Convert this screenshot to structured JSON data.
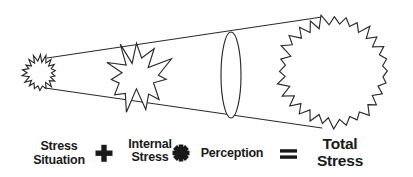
{
  "diagram": {
    "type": "conceptual-equation",
    "background_color": "#ffffff",
    "stroke_color": "#2b2b2b",
    "text_color": "#1a1a1a",
    "equation": {
      "terms": [
        {
          "id": "stress-situation",
          "line1": "Stress",
          "line2": "Situation",
          "emphasis": "normal"
        },
        {
          "id": "internal-stress",
          "line1": "Internal",
          "line2": "Stress",
          "emphasis": "normal"
        },
        {
          "id": "perception",
          "line1": "Perception",
          "line2": "",
          "emphasis": "normal"
        },
        {
          "id": "total-stress",
          "line1": "Total",
          "line2": "Stress",
          "emphasis": "large"
        }
      ],
      "operators": [
        {
          "id": "plus",
          "symbol": "+",
          "name": "plus-operator"
        },
        {
          "id": "times",
          "symbol": "✖",
          "name": "multiply-operator"
        },
        {
          "id": "equals",
          "symbol": "=",
          "name": "equals-operator"
        }
      ],
      "expression": "Stress Situation + Internal Stress × Perception = Total Stress"
    },
    "shapes": [
      {
        "id": "small-burst",
        "name": "small-starburst",
        "label": "Stress Situation",
        "cx": 40,
        "cy": 73,
        "outer_r": 17,
        "inner_r": 12,
        "points": 18
      },
      {
        "id": "mid-burst",
        "name": "explosion-starburst",
        "label": "Internal Stress",
        "cx": 137,
        "cy": 76,
        "outer_r": 34,
        "inner_r": 17,
        "points": 11
      },
      {
        "id": "lens",
        "name": "lens-ellipse",
        "label": "Perception",
        "cx": 231,
        "cy": 75,
        "rx": 10,
        "ry": 43
      },
      {
        "id": "big-burst",
        "name": "large-starburst",
        "label": "Total Stress",
        "cx": 334,
        "cy": 71,
        "outer_r": 56,
        "inner_r": 47,
        "points": 28
      }
    ],
    "cone": {
      "name": "expanding-cone",
      "top_line": {
        "x1": 47,
        "y1": 58,
        "x2": 322,
        "y2": 17
      },
      "bottom_line": {
        "x1": 45,
        "y1": 88,
        "x2": 322,
        "y2": 128
      }
    }
  }
}
